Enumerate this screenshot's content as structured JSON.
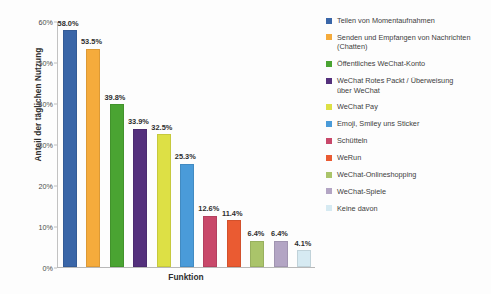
{
  "chart_data": {
    "type": "bar",
    "title": "",
    "subtitle": "",
    "xlabel": "Funktion",
    "ylabel": "Anteil der täglichen Nutzung",
    "ylim": [
      0,
      60
    ],
    "ytick_labels": [
      "0%",
      "10%",
      "20%",
      "30%",
      "40%",
      "50%",
      "60%"
    ],
    "ytick_values": [
      0,
      10,
      20,
      30,
      40,
      50,
      60
    ],
    "grid": false,
    "legend_position": "right",
    "value_suffix": "%",
    "categories": [
      "Teilen von Momentaufnahmen",
      "Senden und Empfangen von Nachrichten (Chatten)",
      "Öffentliches WeChat-Konto",
      "WeChat Rotes Packt / Überweisung über WeChat",
      "WeChat Pay",
      "Emoji, Smiley uns Sticker",
      "Schütteln",
      "WeRun",
      "WeChat-Onlineshopping",
      "WeChat-Spiele",
      "Keine davon"
    ],
    "values": [
      58.0,
      53.5,
      39.8,
      33.9,
      32.5,
      25.3,
      12.6,
      11.4,
      6.4,
      6.4,
      4.1
    ],
    "data_labels": [
      "58.0%",
      "53.5%",
      "39.8%",
      "33.9%",
      "32.5%",
      "25.3%",
      "12.6%",
      "11.4%",
      "6.4%",
      "6.4%",
      "4.1%"
    ],
    "colors": [
      "#3a66a8",
      "#f5ab3c",
      "#4aa432",
      "#54307c",
      "#dde045",
      "#4a9bd9",
      "#c8486a",
      "#ea5b32",
      "#aac46a",
      "#b3a5c4",
      "#d6eaf2"
    ]
  },
  "legend": {
    "entries": [
      {
        "label": "Teilen von Momentaufnahmen",
        "color": "#3a66a8"
      },
      {
        "label": "Senden und Empfangen von Nachrichten\n(Chatten)",
        "color": "#f5ab3c"
      },
      {
        "label": "Öffentliches WeChat-Konto",
        "color": "#4aa432"
      },
      {
        "label": "WeChat Rotes Packt / Überweisung\nüber WeChat",
        "color": "#54307c"
      },
      {
        "label": "WeChat Pay",
        "color": "#dde045"
      },
      {
        "label": "Emoji, Smiley uns Sticker",
        "color": "#4a9bd9"
      },
      {
        "label": "Schütteln",
        "color": "#c8486a"
      },
      {
        "label": "WeRun",
        "color": "#ea5b32"
      },
      {
        "label": "WeChat-Onlineshopping",
        "color": "#aac46a"
      },
      {
        "label": "WeChat-Spiele",
        "color": "#b3a5c4"
      },
      {
        "label": "Keine davon",
        "color": "#d6eaf2"
      }
    ]
  }
}
